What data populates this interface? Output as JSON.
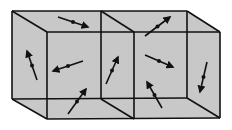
{
  "diagram": {
    "title": "",
    "colors": {
      "background": "#ffffff",
      "face_fill": "#c8c8c8",
      "line": "#111111",
      "arrow": "#111111"
    },
    "boxes": [
      {
        "id": "left-cell",
        "back": [
          [
            12,
            11
          ],
          [
            101,
            11
          ],
          [
            101,
            99
          ],
          [
            12,
            99
          ]
        ],
        "front": [
          [
            47,
            32
          ],
          [
            134,
            32
          ],
          [
            134,
            119
          ],
          [
            47,
            119
          ]
        ]
      },
      {
        "id": "right-cell",
        "back": [
          [
            101,
            11
          ],
          [
            187,
            11
          ],
          [
            187,
            98
          ],
          [
            101,
            98
          ]
        ],
        "front": [
          [
            134,
            32
          ],
          [
            220,
            32
          ],
          [
            220,
            118
          ],
          [
            134,
            118
          ]
        ]
      }
    ],
    "dipoles": [
      {
        "id": "d1",
        "x1": 58,
        "y1": 17,
        "x2": 88,
        "y2": 27,
        "head": "end"
      },
      {
        "id": "d2",
        "x1": 27,
        "y1": 51,
        "x2": 37,
        "y2": 80,
        "head": "start"
      },
      {
        "id": "d3",
        "x1": 53,
        "y1": 71,
        "x2": 83,
        "y2": 61,
        "head": "start"
      },
      {
        "id": "d4",
        "x1": 106,
        "y1": 84,
        "x2": 118,
        "y2": 57,
        "head": "end"
      },
      {
        "id": "d5",
        "x1": 68,
        "y1": 114,
        "x2": 86,
        "y2": 89,
        "head": "end"
      },
      {
        "id": "d6",
        "x1": 145,
        "y1": 36,
        "x2": 170,
        "y2": 17,
        "head": "end"
      },
      {
        "id": "d7",
        "x1": 145,
        "y1": 55,
        "x2": 173,
        "y2": 67,
        "head": "end"
      },
      {
        "id": "d8",
        "x1": 200,
        "y1": 92,
        "x2": 207,
        "y2": 62,
        "head": "start"
      },
      {
        "id": "d9",
        "x1": 147,
        "y1": 82,
        "x2": 162,
        "y2": 108,
        "head": "start"
      }
    ]
  }
}
